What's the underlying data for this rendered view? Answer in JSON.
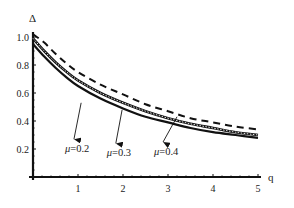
{
  "chart_data": {
    "type": "line",
    "title": "",
    "xlabel": "q",
    "ylabel": "Δ",
    "xlim": [
      0,
      5
    ],
    "ylim": [
      0,
      1.05
    ],
    "x_ticks": [
      "1",
      "2",
      "3",
      "4",
      "5"
    ],
    "y_ticks": [
      "0.2",
      "0.4",
      "0.6",
      "0.8",
      "1.0"
    ],
    "grid": false,
    "legend": "none (inline arrow annotations)",
    "x": [
      0,
      0.25,
      0.5,
      0.75,
      1,
      1.5,
      2,
      2.5,
      3,
      3.5,
      4,
      4.5,
      5
    ],
    "series": [
      {
        "name": "μ=0.2",
        "style": "solid",
        "values": [
          0.95,
          0.86,
          0.78,
          0.71,
          0.65,
          0.56,
          0.49,
          0.43,
          0.39,
          0.35,
          0.32,
          0.3,
          0.28
        ]
      },
      {
        "name": "μ=0.3",
        "style": "double/dotted",
        "values": [
          0.99,
          0.9,
          0.82,
          0.75,
          0.69,
          0.6,
          0.53,
          0.47,
          0.42,
          0.38,
          0.35,
          0.32,
          0.3
        ]
      },
      {
        "name": "μ=0.4",
        "style": "dashed",
        "values": [
          1.02,
          0.96,
          0.88,
          0.81,
          0.75,
          0.66,
          0.59,
          0.52,
          0.47,
          0.42,
          0.39,
          0.36,
          0.34
        ]
      }
    ],
    "annotations": [
      {
        "text": "μ=0.2",
        "mu": "μ",
        "value": "=0.2",
        "arrow_from": [
          1.07,
          0.53
        ],
        "arrow_to": [
          0.91,
          0.27
        ]
      },
      {
        "text": "μ=0.3",
        "mu": "μ",
        "value": "=0.3",
        "arrow_from": [
          1.98,
          0.48
        ],
        "arrow_to": [
          1.84,
          0.24
        ]
      },
      {
        "text": "μ=0.4",
        "mu": "μ",
        "value": "=0.4",
        "arrow_from": [
          3.2,
          0.43
        ],
        "arrow_to": [
          2.89,
          0.25
        ]
      }
    ]
  }
}
